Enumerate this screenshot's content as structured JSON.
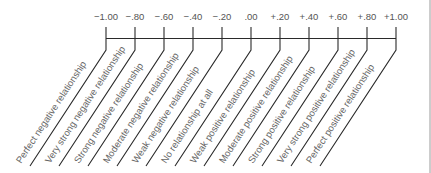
{
  "scale": {
    "ticks": [
      {
        "value": "−1.00",
        "description": "Perfect negative relationship"
      },
      {
        "value": "−.80",
        "description": "Very strong negative relationship"
      },
      {
        "value": "−.60",
        "description": "Strong negative relationship"
      },
      {
        "value": "−.40",
        "description": "Moderate negative relationship"
      },
      {
        "value": "−.20",
        "description": "Weak negative relationship"
      },
      {
        "value": ".00",
        "description": "No relationship at all"
      },
      {
        "value": "+.20",
        "description": "Weak positive relationship"
      },
      {
        "value": "+.40",
        "description": "Moderate positive relationship"
      },
      {
        "value": "+.60",
        "description": "Strong positive relationship"
      },
      {
        "value": "+.80",
        "description": "Very strong positive relationship"
      },
      {
        "value": "+1.00",
        "description": "Perfect positive relationship"
      }
    ]
  },
  "colors": {
    "line": "#2a2a2a",
    "text": "#555555",
    "background": "#ffffff"
  }
}
